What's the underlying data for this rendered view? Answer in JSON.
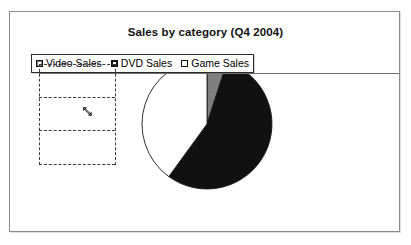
{
  "chart": {
    "title": "Sales by category (Q4 2004)",
    "frame_border_color": "#8a8a8a",
    "background_color": "#ffffff"
  },
  "legend": {
    "position": "top-left-overlay",
    "entries": [
      {
        "label": "Video Sales",
        "color": "#7f7f7f",
        "swatch": "gray-square"
      },
      {
        "label": "DVD Sales",
        "color": "#111111",
        "swatch": "black-square"
      },
      {
        "label": "Game Sales",
        "color": "#ffffff",
        "swatch": "white-square"
      }
    ]
  },
  "selection": {
    "name": "worksheet-cell-range-selection",
    "style": "dashed",
    "rows": 3,
    "resize_cursor": "diagonal-resize-cursor"
  },
  "chart_data": {
    "type": "pie",
    "title": "Sales by category (Q4 2004)",
    "categories": [
      "Video Sales",
      "DVD Sales",
      "Game Sales"
    ],
    "values": [
      5,
      55,
      40
    ],
    "unit": "percent",
    "colors": [
      "#7f7f7f",
      "#111111",
      "#ffffff"
    ],
    "legend_entries": [
      "Video Sales",
      "DVD Sales",
      "Game Sales"
    ],
    "legend_position": "top",
    "start_angle_deg": -90,
    "grid": false,
    "xlabel": "",
    "ylabel": "",
    "annotations": []
  }
}
